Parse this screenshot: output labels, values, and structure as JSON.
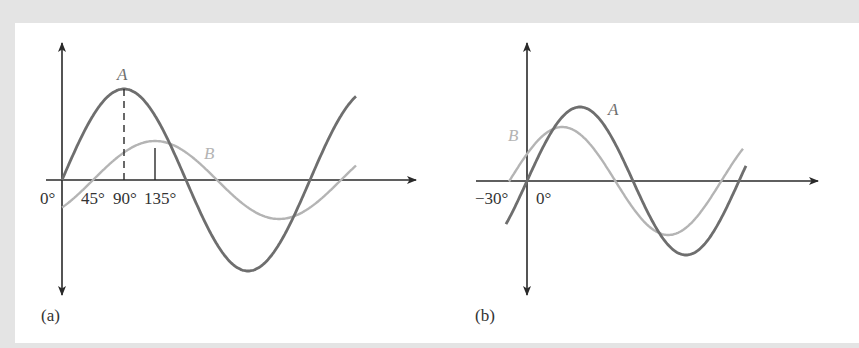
{
  "colors": {
    "background": "#e4e4e4",
    "panel": "#ffffff",
    "axis": "#2a2a2a",
    "wave_A": "#6e6e6e",
    "wave_B": "#b4b4b4",
    "text": "#333333"
  },
  "figure_a": {
    "caption": "(a)",
    "wave_A_label": "A",
    "wave_B_label": "B",
    "tick_labels": [
      "0°",
      "45°",
      "90°",
      "135°"
    ],
    "description": "Wave A leads wave B by 45°"
  },
  "figure_b": {
    "caption": "(b)",
    "wave_A_label": "A",
    "wave_B_label": "B",
    "tick_labels": [
      "−30°",
      "0°"
    ],
    "description": "Wave B leads wave A by 30°"
  },
  "chart_data": [
    {
      "type": "line",
      "title": "(a)",
      "xlabel": "angle (degrees)",
      "ylabel": "",
      "x_ticks": [
        0,
        45,
        90,
        135
      ],
      "series": [
        {
          "name": "A",
          "function": "sin(θ)",
          "amplitude": 1.0,
          "phase_deg": 0,
          "x_range": [
            0,
            430
          ],
          "peak_at_deg": 90
        },
        {
          "name": "B",
          "function": "0.43·sin(θ − 45°)",
          "amplitude": 0.43,
          "phase_deg": -45,
          "x_range": [
            0,
            430
          ],
          "peak_at_deg": 135
        }
      ],
      "annotations": [
        "dashed line at 90° to peak of A",
        "dashed line at 135° to peak of B"
      ]
    },
    {
      "type": "line",
      "title": "(b)",
      "xlabel": "angle (degrees)",
      "ylabel": "",
      "x_ticks": [
        -30,
        0
      ],
      "series": [
        {
          "name": "A",
          "function": "sin(θ)",
          "amplitude": 1.0,
          "phase_deg": 0,
          "x_range": [
            -36,
            408
          ]
        },
        {
          "name": "B",
          "function": "0.73·sin(θ + 30°)",
          "amplitude": 0.73,
          "phase_deg": 30,
          "x_range": [
            -30,
            400
          ]
        }
      ]
    }
  ]
}
